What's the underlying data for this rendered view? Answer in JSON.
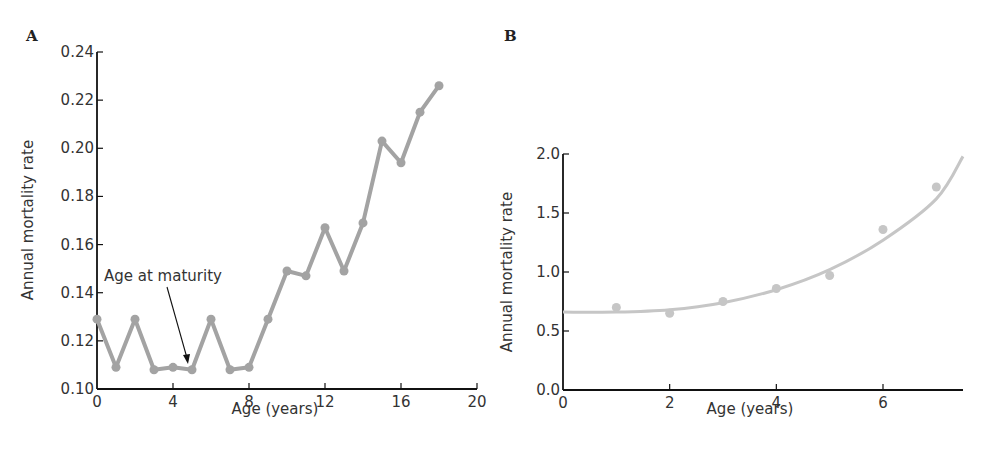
{
  "chart_data": [
    {
      "panel": "A",
      "type": "line",
      "title": "",
      "xlabel": "Age (years)",
      "ylabel": "Annual mortality rate",
      "xlim": [
        0,
        20
      ],
      "ylim": [
        0.1,
        0.24
      ],
      "xticks": [
        0,
        4,
        8,
        12,
        16,
        20
      ],
      "xtick_labels": [
        "0",
        "4",
        "8",
        "12",
        "16",
        "20"
      ],
      "yticks": [
        0.1,
        0.12,
        0.14,
        0.16,
        0.18,
        0.2,
        0.22,
        0.24
      ],
      "ytick_labels": [
        "0.10",
        "0.12",
        "0.14",
        "0.16",
        "0.18",
        "0.20",
        "0.22",
        "0.24"
      ],
      "grid": false,
      "legend": null,
      "series": [
        {
          "name": "Annual mortality rate",
          "color": "#a3a3a3",
          "markers": true,
          "x": [
            0,
            1,
            2,
            3,
            4,
            5,
            6,
            7,
            8,
            9,
            10,
            11,
            12,
            13,
            14,
            15,
            16,
            17,
            18
          ],
          "values": [
            0.129,
            0.109,
            0.129,
            0.108,
            0.109,
            0.108,
            0.129,
            0.108,
            0.109,
            0.129,
            0.149,
            0.147,
            0.167,
            0.149,
            0.169,
            0.203,
            0.194,
            0.215,
            0.226
          ]
        }
      ],
      "annotations": [
        {
          "text": "Age at maturity",
          "arrow_to": {
            "x": 5,
            "y": 0.108
          }
        }
      ]
    },
    {
      "panel": "B",
      "type": "scatter",
      "title": "",
      "xlabel": "Age (years)",
      "ylabel": "Annual mortality rate",
      "xlim": [
        0,
        7.5
      ],
      "ylim": [
        0.0,
        2.0
      ],
      "xticks": [
        0,
        2,
        4,
        6
      ],
      "xtick_labels": [
        "0",
        "2",
        "4",
        "6"
      ],
      "yticks": [
        0.0,
        0.5,
        1.0,
        1.5,
        2.0
      ],
      "ytick_labels": [
        "0.0",
        "0.5",
        "1.0",
        "1.5",
        "2.0"
      ],
      "grid": false,
      "legend": null,
      "series": [
        {
          "name": "Observed",
          "color": "#c6c6c6",
          "x": [
            1,
            2,
            3,
            4,
            5,
            6,
            7
          ],
          "values": [
            0.7,
            0.65,
            0.75,
            0.86,
            0.97,
            1.36,
            1.72
          ]
        },
        {
          "name": "Fitted curve",
          "color": "#c6c6c6",
          "type": "line",
          "x": [
            0,
            1,
            2,
            3,
            4,
            5,
            6,
            7,
            7.5
          ],
          "values": [
            0.66,
            0.66,
            0.68,
            0.74,
            0.85,
            1.02,
            1.27,
            1.62,
            1.98
          ]
        }
      ]
    }
  ],
  "figure": {
    "panel_a_label": "A",
    "panel_b_label": "B",
    "annotation_text": "Age at maturity"
  }
}
